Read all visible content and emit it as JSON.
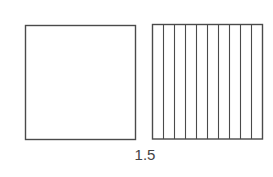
{
  "diagram": {
    "type": "decimal-area-model",
    "caption": "1.5",
    "models": [
      {
        "name": "whole-square",
        "divisions": 1,
        "shaded_parts": 0
      },
      {
        "name": "tenths-square",
        "divisions": 10,
        "shaded_parts": 0
      }
    ],
    "colors": {
      "stroke": "#4a4a4a",
      "fill": "#ffffff"
    }
  }
}
